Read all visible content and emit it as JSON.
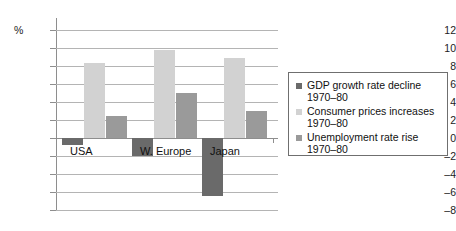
{
  "chart_data": {
    "type": "bar",
    "title": "",
    "subtitle": "",
    "xlabel": "",
    "ylabel": "%",
    "unit_label": "%",
    "categories": [
      "USA",
      "W. Europe",
      "Japan"
    ],
    "series": [
      {
        "name": "GDP growth rate decline",
        "period": "1970–80",
        "legend_line1": "GDP growth rate decline",
        "legend_line2": "1970–80",
        "color": "#6a6a6a",
        "values": [
          -0.8,
          -2.0,
          -6.4
        ]
      },
      {
        "name": "Consumer prices increases",
        "period": "1970–80",
        "legend_line1": "Consumer prices increases",
        "legend_line2": "1970–80",
        "color": "#d2d2d2",
        "values": [
          8.3,
          9.8,
          8.9
        ]
      },
      {
        "name": "Unemployment rate rise",
        "period": "1970–80",
        "legend_line1": "Unemployment rate rise",
        "legend_line2": "1970–80",
        "color": "#9a9a9a",
        "values": [
          2.5,
          5.0,
          3.0
        ]
      }
    ],
    "ylim": [
      -8,
      12
    ],
    "yticks": [
      12,
      10,
      8,
      6,
      4,
      2,
      0,
      -2,
      -4,
      -6,
      -8
    ],
    "ytick_labels": [
      "12",
      "10",
      "8",
      "6",
      "4",
      "2",
      "0",
      "–2",
      "–4",
      "–6",
      "–8"
    ],
    "grid": true,
    "grid_axis": "y",
    "legend_position": "right",
    "frame": "left-and-gridlines"
  },
  "colors": {
    "gdp": "#6a6a6a",
    "prices": "#d2d2d2",
    "unemployment": "#9a9a9a",
    "grid": "#b4b4b4",
    "axis": "#8e8e8e",
    "text": "#111111",
    "legend_border": "#6f6f6f",
    "background": "#ffffff"
  }
}
